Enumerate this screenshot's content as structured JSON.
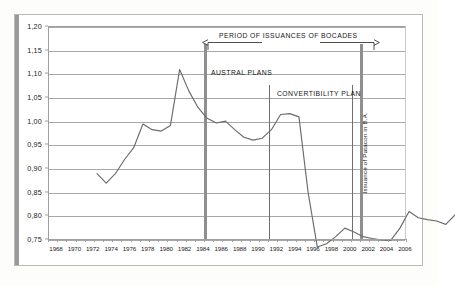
{
  "chart_data": {
    "type": "line",
    "title": "",
    "xlabel": "",
    "ylabel": "",
    "ylim": [
      0.75,
      1.2
    ],
    "xlim": [
      1968,
      2007
    ],
    "grid": true,
    "legend": "none",
    "y_ticks": [
      "1,20",
      "1,15",
      "1,10",
      "1,05",
      "1,00",
      "0,95",
      "0,90",
      "0,85",
      "0,80",
      "0,75"
    ],
    "y_tick_values": [
      1.2,
      1.15,
      1.1,
      1.05,
      1.0,
      0.95,
      0.9,
      0.85,
      0.8,
      0.75
    ],
    "x_ticks": [
      "1968",
      "1970",
      "1972",
      "1974",
      "1976",
      "1978",
      "1980",
      "1982",
      "1984",
      "1986",
      "1988",
      "1990",
      "1992",
      "1994",
      "1996",
      "1998",
      "2000",
      "2002",
      "2004",
      "2006"
    ],
    "x": [
      1968,
      1969,
      1970,
      1971,
      1972,
      1973,
      1974,
      1975,
      1976,
      1977,
      1978,
      1979,
      1980,
      1981,
      1982,
      1983,
      1984,
      1985,
      1986,
      1987,
      1988,
      1989,
      1990,
      1991,
      1992,
      1993,
      1994,
      1995,
      1996,
      1997,
      1998,
      1999,
      2000,
      2001,
      2002,
      2003,
      2004,
      2005,
      2006,
      2007
    ],
    "values": [
      0.945,
      0.925,
      0.945,
      0.975,
      1.0,
      1.05,
      1.038,
      1.035,
      1.047,
      1.165,
      1.12,
      1.085,
      1.062,
      1.052,
      1.056,
      1.038,
      1.022,
      1.016,
      1.02,
      1.038,
      1.07,
      1.072,
      1.065,
      0.905,
      0.79,
      0.797,
      0.812,
      0.83,
      0.822,
      0.812,
      0.808,
      0.805,
      0.804,
      0.83,
      0.865,
      0.852,
      0.848,
      0.845,
      0.838,
      0.858
    ],
    "series": [
      {
        "name": "index",
        "values": [
          0.945,
          0.925,
          0.945,
          0.975,
          1.0,
          1.05,
          1.038,
          1.035,
          1.047,
          1.165,
          1.12,
          1.085,
          1.062,
          1.052,
          1.056,
          1.038,
          1.022,
          1.016,
          1.02,
          1.038,
          1.07,
          1.072,
          1.065,
          0.905,
          0.79,
          0.797,
          0.812,
          0.83,
          0.822,
          0.812,
          0.808,
          0.805,
          0.804,
          0.83,
          0.865,
          0.852,
          0.848,
          0.845,
          0.838,
          0.858
        ],
        "color": "#6b6b6b"
      }
    ],
    "annotations": [
      {
        "id": "bocades",
        "label": "PERIOD OF ISSUANCES OF BOCADES",
        "type": "span-label",
        "from": 1985,
        "to": 2002
      },
      {
        "id": "austral",
        "label": "AUSTRAL PLANS",
        "type": "region-label",
        "from": 1985,
        "to": 1991
      },
      {
        "id": "convert",
        "label": "CONVERTIBILITY PLAN",
        "type": "region-label",
        "from": 1992,
        "to": 2001
      },
      {
        "id": "patacon",
        "label": "Issuance of Patacon in B.A.",
        "type": "vertical-label",
        "at": 2001
      }
    ],
    "markers": [
      {
        "id": "marker-austral-start",
        "x": 1985,
        "style": "thick"
      },
      {
        "id": "marker-convert-start",
        "x": 1992,
        "style": "thin"
      },
      {
        "id": "marker-patacon",
        "x": 2001,
        "style": "thin"
      },
      {
        "id": "marker-convert-end",
        "x": 2002,
        "style": "thick"
      }
    ]
  }
}
